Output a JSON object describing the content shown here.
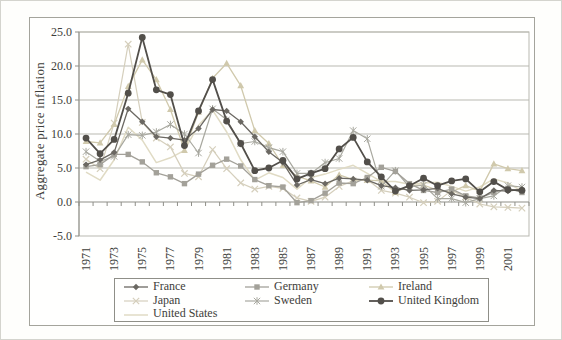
{
  "figure": {
    "ylabel": "Aggregate price inflation"
  },
  "chart_data": {
    "type": "line",
    "title": "",
    "xlabel": "",
    "ylabel": "Aggregate price inflation",
    "ylim": [
      -5.0,
      25.0
    ],
    "yticks": [
      25,
      20,
      15,
      10,
      5,
      0,
      -5
    ],
    "ytick_labels": [
      "25.0",
      "20.0",
      "15.0",
      "10.0",
      "5.0",
      "0.0",
      "-5.0"
    ],
    "grid": "horizontal",
    "legend_position": "bottom",
    "x": [
      1971,
      1972,
      1973,
      1974,
      1975,
      1976,
      1977,
      1978,
      1979,
      1980,
      1981,
      1982,
      1983,
      1984,
      1985,
      1986,
      1987,
      1988,
      1989,
      1990,
      1991,
      1992,
      1993,
      1994,
      1995,
      1996,
      1997,
      1998,
      1999,
      2000,
      2001,
      2002
    ],
    "xtick_labels": [
      "1971",
      "1973",
      "1975",
      "1977",
      "1979",
      "1981",
      "1983",
      "1985",
      "1987",
      "1989",
      "1991",
      "1993",
      "1995",
      "1997",
      "1999",
      "2001"
    ],
    "xtick_every": 2,
    "series": [
      {
        "name": "France",
        "marker": "diamond",
        "color": "#6b6862",
        "line_width": 1.3,
        "values": [
          5.5,
          6.2,
          7.3,
          13.7,
          11.8,
          9.6,
          9.4,
          9.1,
          10.8,
          13.6,
          13.4,
          11.8,
          9.6,
          7.4,
          5.8,
          2.5,
          3.3,
          2.7,
          3.5,
          3.4,
          3.2,
          2.4,
          2.1,
          1.7,
          1.8,
          2.0,
          1.2,
          0.7,
          0.5,
          1.7,
          1.6,
          1.9
        ]
      },
      {
        "name": "Germany",
        "marker": "square",
        "color": "#a3a199",
        "line_width": 1.3,
        "values": [
          5.2,
          5.5,
          7.0,
          7.0,
          5.9,
          4.3,
          3.7,
          2.7,
          4.1,
          5.4,
          6.3,
          5.3,
          3.3,
          2.4,
          2.2,
          -0.1,
          0.2,
          1.3,
          2.8,
          2.7,
          3.6,
          5.1,
          4.5,
          2.7,
          1.7,
          1.4,
          1.9,
          0.9,
          0.6,
          1.4,
          2.0,
          1.4
        ]
      },
      {
        "name": "Ireland",
        "marker": "triangle",
        "color": "#d0c9ac",
        "line_width": 1.3,
        "values": [
          8.9,
          8.7,
          11.4,
          17.0,
          20.9,
          18.0,
          13.6,
          7.6,
          13.2,
          18.2,
          20.4,
          17.1,
          10.5,
          8.6,
          5.4,
          3.8,
          3.1,
          2.2,
          4.0,
          3.3,
          3.2,
          3.1,
          1.4,
          2.4,
          2.5,
          1.7,
          1.5,
          2.4,
          1.6,
          5.6,
          4.9,
          4.6
        ]
      },
      {
        "name": "Japan",
        "marker": "x",
        "color": "#d5cfbc",
        "line_width": 1.2,
        "values": [
          6.3,
          4.9,
          11.6,
          23.2,
          11.7,
          9.4,
          8.1,
          4.2,
          3.7,
          7.7,
          4.9,
          2.8,
          1.9,
          2.3,
          2.0,
          0.6,
          0.1,
          0.7,
          2.3,
          3.1,
          3.3,
          1.7,
          1.3,
          0.7,
          -0.1,
          0.1,
          1.7,
          0.7,
          -0.3,
          -0.7,
          -0.8,
          -0.9
        ]
      },
      {
        "name": "Sweden",
        "marker": "asterisk",
        "color": "#a8a89f",
        "line_width": 1.2,
        "values": [
          7.4,
          6.0,
          6.7,
          9.9,
          9.8,
          10.3,
          11.4,
          10.0,
          7.2,
          13.7,
          12.1,
          8.6,
          8.9,
          8.0,
          7.4,
          4.2,
          4.2,
          5.8,
          6.4,
          10.5,
          9.3,
          2.3,
          4.6,
          2.2,
          2.5,
          0.5,
          0.5,
          -0.1,
          0.5,
          0.9,
          2.4,
          2.2
        ]
      },
      {
        "name": "United Kingdom",
        "marker": "circle",
        "color": "#524f4a",
        "line_width": 1.8,
        "values": [
          9.4,
          7.1,
          9.2,
          16.0,
          24.2,
          16.5,
          15.8,
          8.3,
          13.4,
          18.0,
          11.9,
          8.6,
          4.6,
          5.0,
          6.1,
          3.4,
          4.2,
          4.9,
          7.8,
          9.5,
          5.9,
          3.7,
          1.6,
          2.4,
          3.5,
          2.4,
          3.1,
          3.4,
          1.5,
          3.0,
          1.8,
          1.7
        ]
      },
      {
        "name": "United States",
        "marker": "none",
        "color": "#e0dbc4",
        "line_width": 1.5,
        "values": [
          4.4,
          3.2,
          6.2,
          11.0,
          9.1,
          5.8,
          6.5,
          7.6,
          11.3,
          13.5,
          10.3,
          6.2,
          3.2,
          4.3,
          3.6,
          1.9,
          3.6,
          4.1,
          4.8,
          5.4,
          4.2,
          3.0,
          3.0,
          2.6,
          2.8,
          2.9,
          2.3,
          1.6,
          2.2,
          3.4,
          2.8,
          1.6
        ]
      }
    ]
  },
  "colors": {
    "grid": "#b9b9b1",
    "axis": "#8f8f88",
    "text": "#3e3e3a"
  }
}
